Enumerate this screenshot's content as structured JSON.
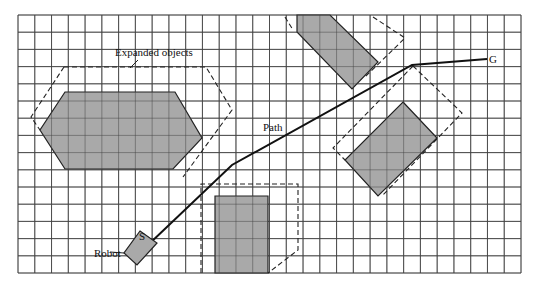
{
  "diagram": {
    "grid": {
      "left": 18,
      "top": 15,
      "right": 521,
      "bottom": 273,
      "cols": 30,
      "rows": 15
    },
    "colors": {
      "obstacle_fill": "#a9a9a9",
      "line": "#222222",
      "background": "#ffffff"
    },
    "labels": {
      "expanded_objects": "Expanded objects",
      "path": "Path",
      "start": "S",
      "goal": "G",
      "robot": "Robot"
    },
    "obstacles": [
      {
        "name": "hexagon",
        "points": "65,92 175,92 202,138 173,169 65,169 40,130"
      },
      {
        "name": "top-rectangle",
        "points": "297,15 330,15 378,62 352,89 297,32"
      },
      {
        "name": "right-rectangle",
        "points": "403,102 437,138 378,196 345,160"
      },
      {
        "name": "bottom-rectangle",
        "points": "215,196 268,196 268,273 215,273"
      }
    ],
    "expanded": [
      {
        "name": "hexagon-expanded",
        "points": "64,67 206,67 232,110 183,177"
      },
      {
        "name": "hexagon-expanded-left",
        "points": "64,67 31,117 40,130"
      },
      {
        "name": "top-expanded",
        "points": "285,17 293,30"
      },
      {
        "name": "top-expanded-right",
        "points": "373,17 405,38 364,78"
      },
      {
        "name": "right-expanded",
        "points": "413,66 462,113 382,196"
      },
      {
        "name": "right-expanded-left",
        "points": "413,66 333,148 345,160"
      },
      {
        "name": "bottom-expanded",
        "points": "201,273 201,184 298,184 298,250 268,273"
      }
    ],
    "path": {
      "points": "148,245 232,165 412,65 487,59"
    },
    "robot": {
      "points": "140,231 157,243 137,265 124,253"
    }
  }
}
